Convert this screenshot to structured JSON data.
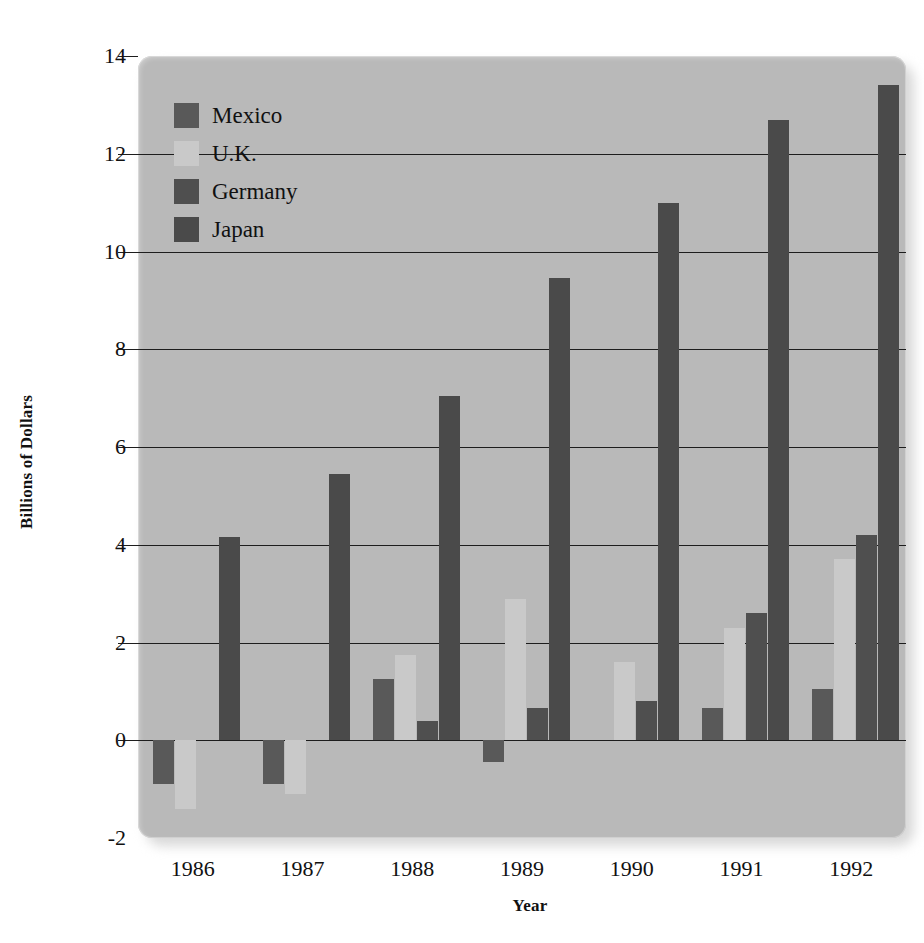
{
  "chart_data": {
    "type": "bar",
    "title": "",
    "subtitle": "",
    "xlabel": "Year",
    "ylabel": "Billions of Dollars",
    "categories": [
      "1986",
      "1987",
      "1988",
      "1989",
      "1990",
      "1991",
      "1992"
    ],
    "series": [
      {
        "name": "Mexico",
        "color": "#595959",
        "values": [
          -0.9,
          -0.9,
          1.25,
          -0.45,
          0.0,
          0.65,
          1.05
        ]
      },
      {
        "name": "U.K.",
        "color": "#c9c9c9",
        "values": [
          -1.4,
          -1.1,
          1.75,
          2.9,
          1.6,
          2.3,
          3.7
        ]
      },
      {
        "name": "Germany",
        "color": "#4f4f4f",
        "values": [
          0.0,
          0.0,
          0.4,
          0.65,
          0.8,
          2.6,
          4.2
        ]
      },
      {
        "name": "Japan",
        "color": "#4a4a4a",
        "values": [
          4.15,
          5.45,
          7.05,
          9.45,
          11.0,
          12.7,
          13.4
        ]
      }
    ],
    "ylim": [
      -2,
      14
    ],
    "yticks": [
      -2,
      0,
      2,
      4,
      6,
      8,
      10,
      12,
      14
    ],
    "ytick_labels": [
      "-2",
      "0",
      "2",
      "4",
      "6",
      "8",
      "10",
      "12",
      "14"
    ],
    "grid": true,
    "grid_axis": "y",
    "legend_position": "top-left",
    "plot_background": "#b9b9b9",
    "axis_color": "#1d1d1d",
    "figure_background": "#ffffff"
  },
  "legend": {
    "items": [
      {
        "label": "Mexico"
      },
      {
        "label": "U.K."
      },
      {
        "label": "Germany"
      },
      {
        "label": "Japan"
      }
    ]
  }
}
